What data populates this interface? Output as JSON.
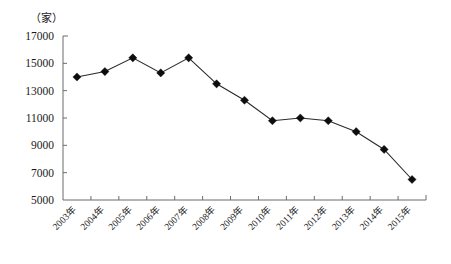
{
  "chart_data": {
    "type": "line",
    "title": "",
    "subtitle": "",
    "xlabel": "",
    "ylabel": "（家）",
    "unit_label": "（家）",
    "categories": [
      "2003年",
      "2004年",
      "2005年",
      "2006年",
      "2007年",
      "2008年",
      "2009年",
      "2010年",
      "2011年",
      "2012年",
      "2013年",
      "2014年",
      "2015年"
    ],
    "values": [
      14000,
      14400,
      15400,
      14300,
      15400,
      13500,
      12300,
      10800,
      11000,
      10800,
      10000,
      8700,
      6500
    ],
    "series": [
      {
        "name": "",
        "values": [
          14000,
          14400,
          15400,
          14300,
          15400,
          13500,
          12300,
          10800,
          11000,
          10800,
          10000,
          8700,
          6500
        ]
      }
    ],
    "ylim": [
      5000,
      17000
    ],
    "ytick_values": [
      17000,
      15000,
      13000,
      11000,
      9000,
      7000,
      5000
    ],
    "ytick_labels": [
      "17000",
      "15000",
      "13000",
      "11000",
      "9000",
      "7000",
      "5000"
    ],
    "grid": false,
    "legend": null,
    "legend_position": "none",
    "marker": "diamond",
    "line_color": "#2a2a2a",
    "marker_color": "#0d0d0d",
    "axis_color": "#6b6b6b",
    "background_color": "#ffffff",
    "xtick_label_rotation": -45
  },
  "layout": {
    "plot_left": 63,
    "plot_right": 426,
    "plot_top": 36,
    "plot_bottom": 200,
    "unit_label_x": 46,
    "unit_label_y": 22
  }
}
